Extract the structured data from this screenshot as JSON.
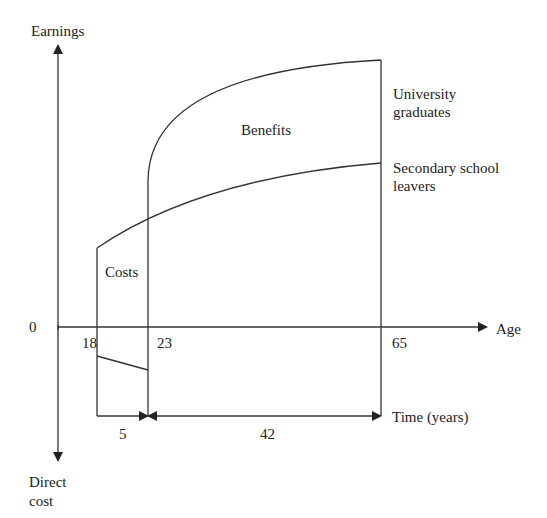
{
  "diagram": {
    "title": "",
    "axes": {
      "y_top_label": "Earnings",
      "y_bottom_label_line1": "Direct",
      "y_bottom_label_line2": "cost",
      "x_label": "Age",
      "origin_label": "0"
    },
    "ticks": {
      "age_start": "18",
      "age_grad": "23",
      "age_retire": "65"
    },
    "curves": {
      "university_line1": "University",
      "university_line2": "graduates",
      "secondary_line1": "Secondary school",
      "secondary_line2": "leavers"
    },
    "regions": {
      "benefits": "Benefits",
      "costs": "Costs"
    },
    "durations": {
      "study_years": "5",
      "work_years": "42",
      "time_label": "Time (years)"
    },
    "colors": {
      "line": "#333333",
      "background": "#ffffff"
    }
  }
}
